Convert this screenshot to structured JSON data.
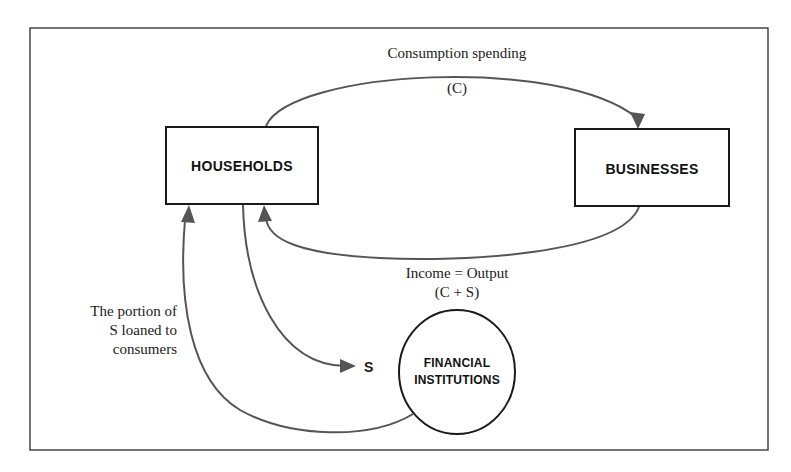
{
  "diagram": {
    "type": "circular-flow",
    "nodes": {
      "households": {
        "label": "HOUSEHOLDS"
      },
      "businesses": {
        "label": "BUSINESSES"
      },
      "financial_institutions": {
        "label_line1": "FINANCIAL",
        "label_line2": "INSTITUTIONS"
      }
    },
    "flows": {
      "consumption": {
        "label": "Consumption spending",
        "sublabel": "(C)",
        "from": "HOUSEHOLDS",
        "to": "BUSINESSES"
      },
      "income": {
        "label": "Income = Output",
        "sublabel": "(C + S)",
        "from": "BUSINESSES",
        "to": "HOUSEHOLDS"
      },
      "savings": {
        "label": "S",
        "from": "HOUSEHOLDS",
        "to": "FINANCIAL INSTITUTIONS"
      },
      "loans": {
        "label_line1": "The portion of",
        "label_line2": "S loaned to",
        "label_line3": "consumers",
        "from": "FINANCIAL INSTITUTIONS",
        "to": "HOUSEHOLDS"
      }
    },
    "colors": {
      "box_stroke": "#1a1a1a",
      "arrow": "#555555",
      "frame": "#2a2a2a"
    }
  }
}
